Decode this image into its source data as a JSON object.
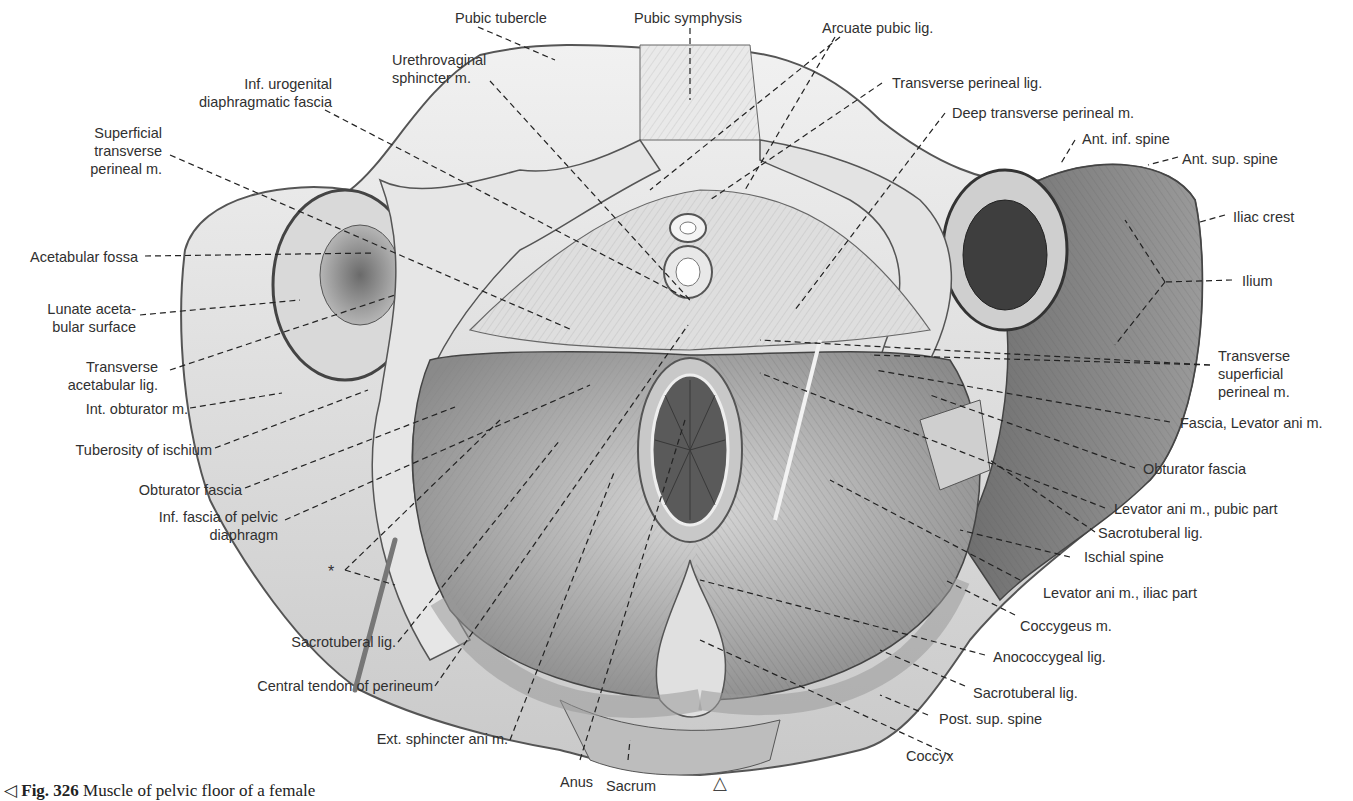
{
  "figure": {
    "caption_marker": "◁",
    "caption_number": "Fig. 326",
    "caption_text": "Muscle of pelvic floor of a female",
    "orientation_marker": "△",
    "colors": {
      "background": "#ffffff",
      "bone": "#e2e2e2",
      "muscle": "#a9a9a9",
      "dark": "#555555",
      "leader": "#222222",
      "text": "#303030"
    }
  },
  "labels": {
    "pubic_tubercle": "Pubic tubercle",
    "pubic_symphysis": "Pubic symphysis",
    "arcuate_pubic_lig": "Arcuate pubic lig.",
    "urethrovaginal_1": "Urethrovaginal",
    "urethrovaginal_2": "sphincter m.",
    "inf_urogenital_1": "Inf. urogenital",
    "inf_urogenital_2": "diaphragmatic fascia",
    "transverse_perineal_lig": "Transverse perineal lig.",
    "deep_transverse_perineal": "Deep transverse perineal m.",
    "superficial_transverse_1": "Superficial",
    "superficial_transverse_2": "transverse",
    "superficial_transverse_3": "perineal m.",
    "ant_inf_spine": "Ant. inf. spine",
    "ant_sup_spine": "Ant. sup. spine",
    "iliac_crest": "Iliac crest",
    "acetabular_fossa": "Acetabular fossa",
    "ilium": "Ilium",
    "lunate_1": "Lunate aceta-",
    "lunate_2": "bular surface",
    "transverse_acetabular_1": "Transverse",
    "transverse_acetabular_2": "acetabular lig.",
    "transverse_superficial_1": "Transverse",
    "transverse_superficial_2": "superficial",
    "transverse_superficial_3": "perineal m.",
    "int_obturator": "Int. obturator m.",
    "fascia_levator": "Fascia, Levator ani m.",
    "tuberosity_ischium": "Tuberosity of ischium",
    "obturator_fascia_right": "Obturator fascia",
    "obturator_fascia_left": "Obturator fascia",
    "inf_fascia_1": "Inf. fascia of pelvic",
    "inf_fascia_2": "diaphragm",
    "levator_pubic": "Levator ani m., pubic part",
    "sacrotuberal_right_upper": "Sacrotuberal lig.",
    "ischial_spine": "Ischial spine",
    "asterisk": "*",
    "levator_iliac": "Levator ani m., iliac part",
    "coccygeus": "Coccygeus m.",
    "sacrotuberal_left": "Sacrotuberal lig.",
    "anococcygeal": "Anococcygeal lig.",
    "central_tendon": "Central tendon of perineum",
    "sacrotuberal_right_lower": "Sacrotuberal lig.",
    "post_sup_spine": "Post. sup. spine",
    "ext_sphincter": "Ext. sphincter ani m.",
    "coccyx": "Coccyx",
    "anus": "Anus",
    "sacrum": "Sacrum"
  }
}
